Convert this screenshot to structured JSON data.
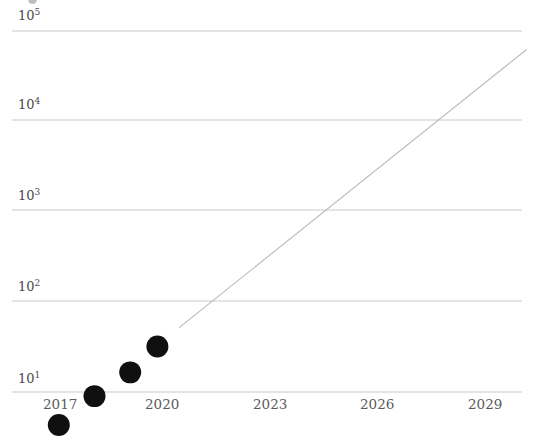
{
  "chart_data": {
    "type": "scatter",
    "title": "",
    "subtitle": "",
    "xlabel": "",
    "ylabel": "",
    "yscale": "log",
    "xscale": "linear",
    "grid": true,
    "grid_axis": "y",
    "legend": false,
    "legend_position": "none",
    "xlim": [
      2015.6,
      2030.2
    ],
    "ylim": [
      3.0,
      120000
    ],
    "x_ticks": [
      2017,
      2020,
      2023,
      2026,
      2029
    ],
    "x_tick_labels": [
      "2017",
      "2020",
      "2023",
      "2026",
      "2029"
    ],
    "y_ticks": [
      10,
      100,
      1000,
      10000,
      100000
    ],
    "y_tick_labels": [
      "10^1",
      "10^2",
      "10^3",
      "10^4",
      "10^5"
    ],
    "y_tick_mantissa": [
      "10",
      "10",
      "10",
      "10",
      "10"
    ],
    "y_tick_exponent": [
      "1",
      "2",
      "3",
      "4",
      "5"
    ],
    "series": [
      {
        "name": "observations",
        "type": "scatter",
        "marker": "circle",
        "color": "#101010",
        "marker_size": 20,
        "points": [
          {
            "x": 2016.95,
            "y": 4.3
          },
          {
            "x": 2018.0,
            "y": 9.0
          },
          {
            "x": 2019.05,
            "y": 16.5
          },
          {
            "x": 2019.85,
            "y": 32.0
          }
        ]
      },
      {
        "name": "trend-projection",
        "type": "line",
        "style": "solid",
        "color": "#b9b9b9",
        "linewidth": 1,
        "points": [
          {
            "x": 2020.5,
            "y": 52.0
          },
          {
            "x": 2030.7,
            "y": 62000
          }
        ]
      }
    ],
    "annotations": []
  },
  "axes": {
    "y_axis_name": "y-axis-log-scale",
    "x_axis_name": "x-axis-years"
  },
  "colors": {
    "background": "#ffffff",
    "gridline": "#c9c9c9",
    "marker": "#101010",
    "trendline": "#b9b9b9",
    "tick_text": "#4a4a4a"
  }
}
